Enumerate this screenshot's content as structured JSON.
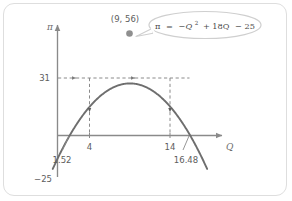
{
  "figure": {
    "name": "profit-parabola-diagram",
    "background": "#ffffff",
    "frame_color": "#dedede"
  },
  "chart_data": {
    "type": "line",
    "title": "",
    "subtitle": "",
    "xlabel": "Q",
    "ylabel": "π",
    "equation_text": "π = −Q2 + 18Q − 25",
    "equation_parts": {
      "lhs": "π",
      "eq": "=",
      "term1": "−Q",
      "exponent": "2",
      "term2": "+ 18Q",
      "term3": "− 25"
    },
    "function": {
      "a": -1,
      "b": 18,
      "c": -25
    },
    "xlim": [
      -1.6,
      19.2
    ],
    "ylim": [
      -34,
      62
    ],
    "grid": false,
    "legend": false,
    "annotations": [
      {
        "name": "vertex",
        "label": "(9, 56)",
        "x": 9,
        "y": 56,
        "marker": "dot"
      },
      {
        "name": "root-left",
        "label": "1.52",
        "x": 1.52,
        "y": 0
      },
      {
        "name": "root-right",
        "label": "16.48",
        "x": 16.48,
        "y": 0
      },
      {
        "name": "y-intercept",
        "label": "−25",
        "x": 0,
        "y": -25
      },
      {
        "name": "profit-level",
        "label": "31",
        "x": null,
        "y": 31
      },
      {
        "name": "q-low",
        "label": "4",
        "x": 4,
        "y": 0
      },
      {
        "name": "q-high",
        "label": "14",
        "x": 14,
        "y": 0
      }
    ],
    "tick_labels": {
      "x": [
        "4",
        "14"
      ],
      "y": [
        "31",
        "−25"
      ]
    },
    "construction_lines": [
      {
        "name": "profit-guide-horizontal",
        "from_y": 31,
        "style": "dashed",
        "arrows": 3
      },
      {
        "name": "q-low-drop",
        "x": 4,
        "style": "dashed",
        "arrow": "down"
      },
      {
        "name": "q-high-drop",
        "x": 14,
        "style": "dashed",
        "arrow": "down"
      }
    ],
    "colors": {
      "curve": "#6e6e6e",
      "axis": "#8a8a8a",
      "dashed": "#8a8a8a",
      "marker": "#8f8f8f",
      "callout": "#cfcfcf",
      "text": "#5d5d5d"
    }
  },
  "labels": {
    "y_axis": "π",
    "x_axis": "Q",
    "vertex": "(9, 56)",
    "profit_level": "31",
    "q_low": "4",
    "q_high": "14",
    "root_left": "1.52",
    "root_right": "16.48",
    "y_intercept": "−25",
    "eq_lhs": "π",
    "eq_sign": "=",
    "eq_t1": "−Q",
    "eq_sup": "2",
    "eq_t2": "+ 18Q",
    "eq_t3": "− 25"
  }
}
